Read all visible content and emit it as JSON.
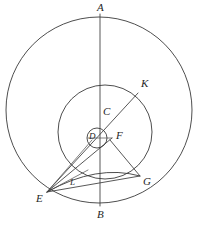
{
  "figure": {
    "kind": "geometry-diagram",
    "width": 199,
    "height": 226,
    "background_color": "#ffffff",
    "stroke_color": "#3a3a3a",
    "label_color": "#262626"
  },
  "labels": {
    "A": "A",
    "B": "B",
    "C": "C",
    "D": "D",
    "E": "E",
    "F": "F",
    "G": "G",
    "K": "K",
    "L": "L"
  },
  "points": [
    {
      "id": "A",
      "label": "A",
      "x": 100,
      "y": 16,
      "label_x": 97,
      "label_y": 2
    },
    {
      "id": "B",
      "label": "B",
      "x": 100,
      "y": 205,
      "label_x": 97,
      "label_y": 209
    },
    {
      "id": "C",
      "label": "C",
      "x": 100,
      "y": 120,
      "label_x": 103,
      "label_y": 106
    },
    {
      "id": "D",
      "label": "D",
      "x": 94,
      "y": 138,
      "label_x": 89,
      "label_y": 132
    },
    {
      "id": "E",
      "label": "E",
      "x": 47,
      "y": 192,
      "label_x": 36,
      "label_y": 193
    },
    {
      "id": "F",
      "label": "F",
      "x": 112,
      "y": 138,
      "label_x": 116,
      "label_y": 130
    },
    {
      "id": "G",
      "label": "G",
      "x": 140,
      "y": 176,
      "label_x": 143,
      "label_y": 176
    },
    {
      "id": "K",
      "label": "K",
      "x": 138,
      "y": 93,
      "label_x": 141,
      "label_y": 78
    },
    {
      "id": "L",
      "label": "L",
      "x": 71,
      "y": 179,
      "label_x": 70,
      "label_y": 178
    }
  ],
  "circles": [
    {
      "id": "outer-circle",
      "cx": 99,
      "cy": 110,
      "r": 93
    },
    {
      "id": "middle-circle",
      "cx": 105,
      "cy": 132,
      "r": 47
    },
    {
      "id": "small-circle",
      "cx": 97,
      "cy": 138,
      "r": 10
    }
  ],
  "segments": [
    {
      "id": "segment-AB",
      "from": "A",
      "to": "B",
      "d": "M 100 14 L 100 206"
    },
    {
      "id": "segment-EK",
      "from": "E",
      "to": "K",
      "d": "M 47 192 L 138 93"
    },
    {
      "id": "segment-EF",
      "from": "E",
      "to": "F",
      "d": "M 47 192 L 112 138"
    },
    {
      "id": "segment-ED",
      "from": "E",
      "to": "D",
      "d": "M 47 192 L 92 140"
    },
    {
      "id": "segment-EG",
      "from": "E",
      "to": "G",
      "d": "M 47 192 L 140 176"
    },
    {
      "id": "segment-FG",
      "from": "F",
      "to": "G",
      "d": "M 110 140 L 140 176"
    },
    {
      "id": "segment-EL",
      "from": "E",
      "to": "L",
      "d": "M 47 192 L 88 170"
    }
  ],
  "arcs": [
    {
      "id": "arc-E-L-G",
      "from": "E",
      "through": "L",
      "to": "G",
      "d": "M 47 192 Q 97 164 140 176"
    }
  ],
  "caption": ""
}
